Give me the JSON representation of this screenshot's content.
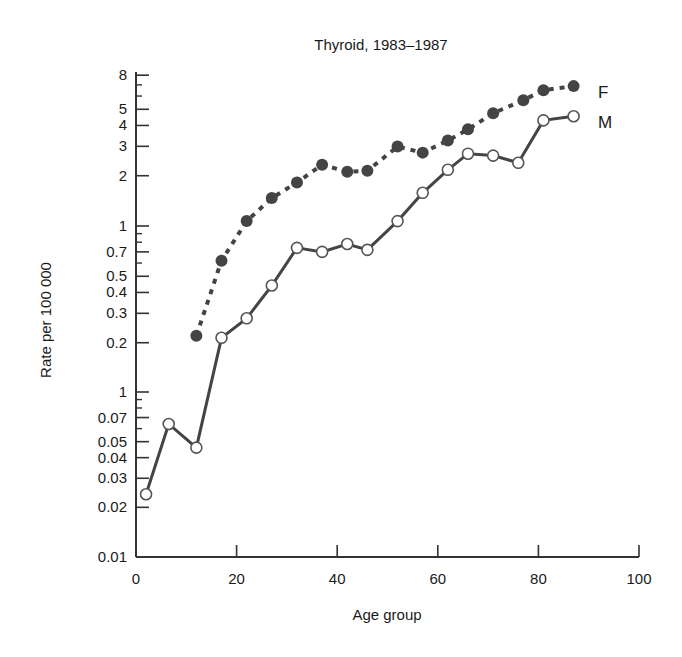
{
  "chart_data": {
    "type": "line",
    "title": "Thyroid, 1983–1987",
    "xlabel": "Age group",
    "ylabel": "Rate per 100 000",
    "x_scale": "linear",
    "y_scale": "log (broken axis: lower panel 0.01–0.1, upper panel 0.2–8)",
    "xlim": [
      0,
      100
    ],
    "ylim": [
      0.01,
      8
    ],
    "x_ticks": [
      0,
      20,
      40,
      60,
      80,
      100
    ],
    "y_ticks_upper": [
      {
        "value": 8,
        "label": "8"
      },
      {
        "value": 5,
        "label": "5"
      },
      {
        "value": 4,
        "label": "4"
      },
      {
        "value": 3,
        "label": "3"
      },
      {
        "value": 2,
        "label": "2"
      },
      {
        "value": 1,
        "label": "1"
      },
      {
        "value": 0.7,
        "label": "0.7"
      },
      {
        "value": 0.5,
        "label": "0.5"
      },
      {
        "value": 0.4,
        "label": "0.4"
      },
      {
        "value": 0.3,
        "label": "0.3"
      },
      {
        "value": 0.2,
        "label": "0.2"
      }
    ],
    "y_ticks_lower": [
      {
        "value": 0.1,
        "label": "1"
      },
      {
        "value": 0.07,
        "label": "0.07"
      },
      {
        "value": 0.05,
        "label": "0.05"
      },
      {
        "value": 0.04,
        "label": "0.04"
      },
      {
        "value": 0.03,
        "label": "0.03"
      },
      {
        "value": 0.02,
        "label": "0.02"
      },
      {
        "value": 0.01,
        "label": "0.01"
      }
    ],
    "grid": false,
    "legend": "inline labels at right end of each series",
    "series": [
      {
        "name": "F",
        "marker": "filled circle",
        "line": "dotted",
        "x": [
          12,
          17,
          22,
          27,
          32,
          37,
          42,
          46,
          52,
          57,
          62,
          66,
          71,
          77,
          81,
          87
        ],
        "values": [
          0.22,
          0.62,
          1.07,
          1.47,
          1.82,
          2.33,
          2.11,
          2.14,
          2.99,
          2.75,
          3.25,
          3.79,
          4.73,
          5.67,
          6.5,
          6.88
        ]
      },
      {
        "name": "M",
        "marker": "open circle",
        "line": "solid",
        "x": [
          2,
          6.5,
          12,
          17,
          22,
          27,
          32,
          37,
          42,
          46,
          52,
          57,
          62,
          66,
          71,
          76,
          81,
          87
        ],
        "values": [
          0.024,
          0.064,
          0.046,
          0.214,
          0.28,
          0.44,
          0.74,
          0.7,
          0.78,
          0.72,
          1.07,
          1.58,
          2.17,
          2.71,
          2.64,
          2.39,
          4.29,
          4.54
        ]
      }
    ]
  }
}
